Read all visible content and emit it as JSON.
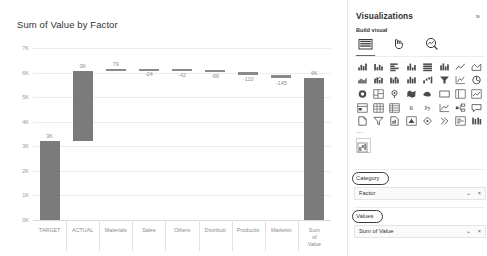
{
  "chart_data": {
    "type": "bar",
    "subtype": "waterfall",
    "title": "Sum of Value by Factor",
    "xlabel": "",
    "ylabel": "",
    "ylim": [
      0,
      7000
    ],
    "ytick_labels": [
      "0K",
      "1K",
      "2K",
      "3K",
      "4K",
      "5K",
      "6K",
      "7K"
    ],
    "ytick_values": [
      0,
      1000,
      2000,
      3000,
      4000,
      5000,
      6000,
      7000
    ],
    "grid": true,
    "legend": "none",
    "categories": [
      "TARGET",
      "ACTUAL",
      "Materials",
      "Sales",
      "Others",
      "Distributi",
      "Productio",
      "Marketin",
      "Sum of\nValue"
    ],
    "category_labels_full": [
      "TARGET",
      "ACTUAL",
      "Materials",
      "Sales",
      "Others",
      "Distributi",
      "Productio",
      "Marketin",
      "Sum of Value"
    ],
    "data_labels": [
      "3K",
      "3K",
      "79",
      "-24",
      "-42",
      "-66",
      "-110",
      "-145",
      "6K"
    ],
    "values": [
      3220,
      2860,
      79,
      -24,
      -42,
      -66,
      -110,
      -145,
      5772
    ],
    "bar_spans": [
      {
        "category": "TARGET",
        "start": 0,
        "end": 3220,
        "label": "3K",
        "label_pos": "above"
      },
      {
        "category": "ACTUAL",
        "start": 3220,
        "end": 6080,
        "label": "3K",
        "label_pos": "above"
      },
      {
        "category": "Materials",
        "start": 6080,
        "end": 6159,
        "label": "79",
        "label_pos": "above"
      },
      {
        "category": "Sales",
        "start": 6135,
        "end": 6159,
        "label": "-24",
        "label_pos": "below"
      },
      {
        "category": "Others",
        "start": 6093,
        "end": 6135,
        "label": "-42",
        "label_pos": "below"
      },
      {
        "category": "Distributi",
        "start": 6027,
        "end": 6093,
        "label": "-66",
        "label_pos": "below"
      },
      {
        "category": "Productio",
        "start": 5917,
        "end": 6027,
        "label": "-110",
        "label_pos": "below"
      },
      {
        "category": "Marketin",
        "start": 5772,
        "end": 5917,
        "label": "-145",
        "label_pos": "below"
      },
      {
        "category": "Sum of Value",
        "start": 0,
        "end": 5772,
        "label": "6K",
        "label_pos": "above"
      }
    ],
    "bar_color": "#7b7b7b",
    "gridline_color": "#ececed",
    "axis_text_color": "#9a9a9a"
  },
  "viz_panel": {
    "title": "Visualizations",
    "expand_icon": "»",
    "build_visual_label": "Build visual",
    "tabs": [
      {
        "name": "fields-tab",
        "icon": "bar-chart-icon",
        "selected": true
      },
      {
        "name": "format-tab",
        "icon": "paint-roller-icon",
        "selected": false
      },
      {
        "name": "analytics-tab",
        "icon": "magnifier-icon",
        "selected": false
      }
    ],
    "grid_more_label": "…",
    "wells": [
      {
        "name": "category",
        "label": "Category",
        "annotated": true,
        "fields": [
          {
            "name": "Factor",
            "chevron": "⌄",
            "remove": "×"
          }
        ]
      },
      {
        "name": "values",
        "label": "Values",
        "annotated": true,
        "fields": [
          {
            "name": "Sum of Value",
            "chevron": "⌄",
            "remove": "×"
          }
        ]
      }
    ]
  }
}
